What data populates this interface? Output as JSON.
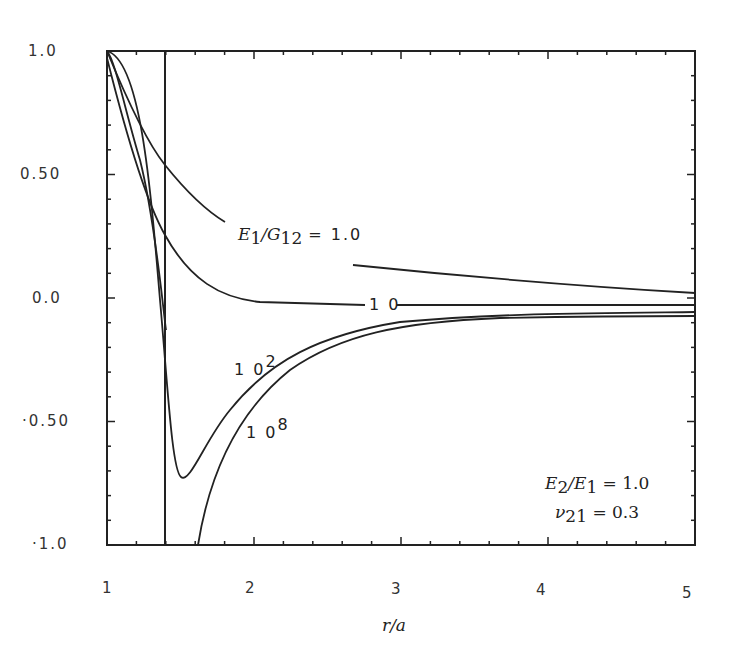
{
  "chart_data": {
    "type": "line",
    "title": "",
    "xlabel": "r/a",
    "ylabel": "",
    "xlim": [
      1,
      5
    ],
    "ylim": [
      -1.0,
      1.0
    ],
    "grid": false,
    "x_ticks": [
      "1",
      "2",
      "3",
      "4",
      "5"
    ],
    "y_ticks": [
      "1.0",
      "0.50",
      "0.0",
      "-0.50",
      "-1.0"
    ],
    "annotations": [
      "E1/G12 = 1.0",
      "10",
      "10^2",
      "10^8",
      "E2/E1 = 1.0",
      "ν21 = 0.3"
    ],
    "vertical_line_x": 1.4,
    "series": [
      {
        "name": "E1/G12 = 1.0",
        "x": [
          1.0,
          1.2,
          1.4,
          1.6,
          1.8,
          2.7,
          3.0,
          4.0,
          5.0
        ],
        "y": [
          1.0,
          0.68,
          0.54,
          0.42,
          0.31,
          0.13,
          0.11,
          0.06,
          0.02
        ]
      },
      {
        "name": "10",
        "x": [
          1.0,
          1.2,
          1.4,
          1.6,
          1.8,
          2.0,
          2.5,
          3.0,
          4.0,
          5.0
        ],
        "y": [
          0.96,
          0.6,
          0.26,
          0.1,
          0.02,
          -0.02,
          -0.04,
          -0.04,
          -0.03,
          -0.03
        ]
      },
      {
        "name": "10^2",
        "x": [
          1.0,
          1.1,
          1.2,
          1.3,
          1.4,
          1.5,
          1.6,
          1.8,
          2.0,
          2.5,
          3.0,
          4.0,
          5.0
        ],
        "y": [
          1.0,
          0.85,
          0.6,
          0.1,
          -0.45,
          -0.73,
          -0.65,
          -0.42,
          -0.29,
          -0.16,
          -0.11,
          -0.08,
          -0.06
        ]
      },
      {
        "name": "10^8",
        "x": [
          1.0,
          1.2,
          1.4,
          1.62,
          1.8,
          2.0,
          2.5,
          3.0,
          4.0,
          5.0
        ],
        "y": [
          1.0,
          0.7,
          0.0,
          -1.0,
          -0.63,
          -0.43,
          -0.2,
          -0.13,
          -0.09,
          -0.07
        ]
      }
    ]
  },
  "labels": {
    "x_axis": "r/a",
    "x_ticks": [
      "1",
      "2",
      "3",
      "4",
      "5"
    ],
    "y_ticks": [
      "1.0",
      "0.50",
      "0.0",
      "·0.50",
      "·1.0"
    ],
    "curve_1": {
      "lhs_E": "E",
      "lhs_sub1": "1",
      "lhs_G": "/G",
      "lhs_sub2": "12",
      "rhs": "= 1.0"
    },
    "curve_10": "1 0",
    "curve_100_base": "1 0",
    "curve_100_exp": "2",
    "curve_1e8_base": "1 0",
    "curve_1e8_exp": "8",
    "params_line1": {
      "E": "E",
      "sub2": "2",
      "slash": "/E",
      "sub1": "1",
      "rhs": " = 1.0"
    },
    "params_line2": {
      "nu": "ν",
      "sub": "21",
      "rhs": " = 0.3"
    }
  }
}
